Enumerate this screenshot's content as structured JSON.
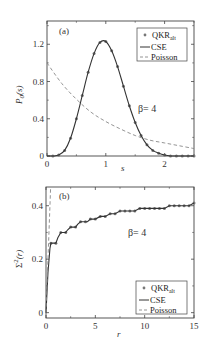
{
  "chart_data": [
    {
      "panel": "(a)",
      "type": "line",
      "xlabel": "s",
      "ylabel": "P0(s)",
      "xlim": [
        0,
        2.5
      ],
      "ylim": [
        0,
        1.45
      ],
      "xticks": [
        "0",
        "1",
        "2"
      ],
      "yticks": [
        "0",
        "0.4",
        "0.8",
        "1.2"
      ],
      "annotation": "β= 4",
      "legend": [
        "QKR_alt",
        "CSE",
        "Poisson"
      ],
      "legend_position": "upper right",
      "series": [
        {
          "name": "QKR_alt",
          "style": "markers",
          "x": [
            0.1,
            0.2,
            0.3,
            0.4,
            0.5,
            0.6,
            0.7,
            0.8,
            0.9,
            1.0,
            1.1,
            1.2,
            1.3,
            1.4,
            1.5,
            1.6,
            1.7,
            1.8,
            1.9,
            2.0,
            2.1,
            2.2,
            2.3,
            2.4,
            2.5
          ],
          "y": [
            0.0,
            0.01,
            0.06,
            0.19,
            0.4,
            0.65,
            0.9,
            1.1,
            1.22,
            1.23,
            1.13,
            0.96,
            0.75,
            0.54,
            0.36,
            0.22,
            0.12,
            0.06,
            0.03,
            0.01,
            0.0,
            0.0,
            0.0,
            0.0,
            0.0
          ]
        },
        {
          "name": "CSE",
          "style": "solid",
          "x": [
            0,
            0.1,
            0.2,
            0.3,
            0.4,
            0.5,
            0.6,
            0.7,
            0.8,
            0.9,
            1.0,
            1.1,
            1.2,
            1.3,
            1.4,
            1.5,
            1.6,
            1.7,
            1.8,
            1.9,
            2.0,
            2.1,
            2.2,
            2.3,
            2.4,
            2.5
          ],
          "y": [
            0,
            0.0,
            0.01,
            0.06,
            0.19,
            0.4,
            0.65,
            0.9,
            1.1,
            1.22,
            1.23,
            1.13,
            0.96,
            0.75,
            0.54,
            0.36,
            0.22,
            0.12,
            0.06,
            0.03,
            0.01,
            0.0,
            0.0,
            0.0,
            0.0,
            0.0
          ]
        },
        {
          "name": "Poisson",
          "style": "dashed",
          "x": [
            0,
            0.25,
            0.5,
            0.75,
            1.0,
            1.25,
            1.5,
            1.75,
            2.0,
            2.25,
            2.5
          ],
          "y": [
            1.0,
            0.78,
            0.61,
            0.47,
            0.37,
            0.29,
            0.22,
            0.17,
            0.14,
            0.11,
            0.08
          ]
        }
      ]
    },
    {
      "panel": "(b)",
      "type": "line",
      "xlabel": "r",
      "ylabel": "Σ²(r)",
      "xlim": [
        0,
        15
      ],
      "ylim": [
        -0.02,
        0.47
      ],
      "xticks": [
        "0",
        "5",
        "10",
        "15"
      ],
      "yticks": [
        "0",
        "0.2",
        "0.4"
      ],
      "annotation": "β= 4",
      "legend": [
        "QKR_alt",
        "CSE",
        "Poisson"
      ],
      "legend_position": "lower right",
      "series": [
        {
          "name": "QKR_alt",
          "style": "markers",
          "x": [
            0.5,
            1,
            1.5,
            2,
            2.5,
            3,
            3.5,
            4,
            4.5,
            5,
            5.5,
            6,
            6.5,
            7,
            7.5,
            8,
            8.5,
            9,
            9.5,
            10,
            10.5,
            11,
            11.5,
            12,
            12.5,
            13,
            13.5,
            14,
            14.5,
            15
          ],
          "y": [
            0.26,
            0.26,
            0.3,
            0.3,
            0.32,
            0.32,
            0.34,
            0.34,
            0.35,
            0.35,
            0.36,
            0.36,
            0.37,
            0.37,
            0.38,
            0.38,
            0.38,
            0.38,
            0.39,
            0.39,
            0.39,
            0.39,
            0.39,
            0.39,
            0.4,
            0.4,
            0.4,
            0.4,
            0.4,
            0.41
          ]
        },
        {
          "name": "CSE",
          "style": "solid",
          "x": [
            0,
            0.2,
            0.4,
            0.5,
            0.8,
            1,
            1.2,
            1.5,
            2,
            2.2,
            2.5,
            3,
            3.2,
            3.5,
            4,
            4.2,
            4.5,
            5,
            5.5,
            6,
            6.5,
            7,
            7.5,
            8,
            8.5,
            9,
            9.5,
            10,
            10.5,
            11,
            11.5,
            12,
            12.5,
            13,
            13.5,
            14,
            14.5,
            15
          ],
          "y": [
            0,
            0.15,
            0.24,
            0.26,
            0.26,
            0.26,
            0.28,
            0.3,
            0.3,
            0.31,
            0.32,
            0.32,
            0.33,
            0.34,
            0.34,
            0.34,
            0.35,
            0.35,
            0.36,
            0.36,
            0.37,
            0.37,
            0.38,
            0.38,
            0.38,
            0.38,
            0.39,
            0.39,
            0.39,
            0.39,
            0.39,
            0.39,
            0.4,
            0.4,
            0.4,
            0.4,
            0.4,
            0.41
          ]
        },
        {
          "name": "Poisson",
          "style": "dashed",
          "x": [
            0,
            0.47
          ],
          "y": [
            0,
            0.47
          ]
        }
      ]
    }
  ],
  "panel_a": {
    "label": "(a)",
    "ylabel_main": "P",
    "ylabel_sub": "0",
    "ylabel_arg": "(s)",
    "xlabel": "s",
    "beta": "β= 4",
    "legend": {
      "qkr": "QKR",
      "qkr_sub": "alt",
      "cse": "CSE",
      "poisson": "Poisson"
    },
    "yticks": [
      "0",
      "0.4",
      "0.8",
      "1.2"
    ],
    "xticks": [
      "0",
      "1",
      "2"
    ]
  },
  "panel_b": {
    "label": "(b)",
    "ylabel_main": "Σ",
    "ylabel_sup": "2",
    "ylabel_arg": "(r)",
    "xlabel": "r",
    "beta": "β= 4",
    "legend": {
      "qkr": "QKR",
      "qkr_sub": "alt",
      "cse": "CSE",
      "poisson": "Poisson"
    },
    "yticks": [
      "0",
      "0.2",
      "0.4"
    ],
    "xticks": [
      "0",
      "5",
      "10",
      "15"
    ]
  },
  "colors": {
    "axis": "#444444",
    "cse": "#333333",
    "markers": "#777777",
    "poisson": "#888888"
  }
}
